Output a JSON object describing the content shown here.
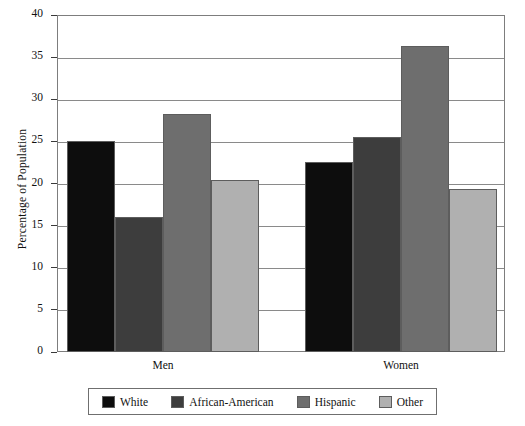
{
  "chart_data": {
    "type": "bar",
    "title": "",
    "xlabel": "",
    "ylabel": "Percentage of Population",
    "categories": [
      "Men",
      "Women"
    ],
    "series": [
      {
        "name": "White",
        "color": "#0d0d0d",
        "values": [
          25.0,
          22.5
        ]
      },
      {
        "name": "African-American",
        "color": "#3d3d3d",
        "values": [
          16.0,
          25.5
        ]
      },
      {
        "name": "Hispanic",
        "color": "#6e6e6e",
        "values": [
          28.2,
          36.3
        ]
      },
      {
        "name": "Other",
        "color": "#b0b0b0",
        "values": [
          20.4,
          19.4
        ]
      }
    ],
    "ylim": [
      0,
      40
    ],
    "ytick_step": 5,
    "yticks": [
      "0",
      "5",
      "10",
      "15",
      "20",
      "25",
      "30",
      "35",
      "40"
    ],
    "grid": "horizontal",
    "legend_position": "bottom"
  },
  "axis": {
    "y_title": "Percentage of Population"
  },
  "groups": [
    {
      "label": "Men"
    },
    {
      "label": "Women"
    }
  ],
  "legend": {
    "items": [
      {
        "label": "White"
      },
      {
        "label": "African-American"
      },
      {
        "label": "Hispanic"
      },
      {
        "label": "Other"
      }
    ]
  }
}
